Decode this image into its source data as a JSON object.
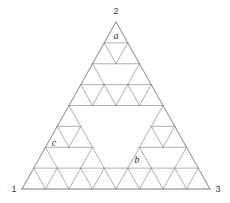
{
  "figure": {
    "type": "sierpinski-triangle",
    "title": "",
    "order": 3,
    "units_per_side": 8,
    "stroke_color": "#8c8c8c",
    "stroke_width": 0.7,
    "background_color": "#ffffff",
    "geometry": {
      "apex": {
        "x": 116,
        "y": 22
      },
      "base_left": {
        "x": 22,
        "y": 189
      },
      "base_right": {
        "x": 210,
        "y": 189
      }
    },
    "vertex_labels": [
      {
        "id": "vertex-1",
        "text": "1",
        "x": 14,
        "y": 192
      },
      {
        "id": "vertex-2",
        "text": "2",
        "x": 116,
        "y": 14
      },
      {
        "id": "vertex-3",
        "text": "3",
        "x": 218,
        "y": 192
      }
    ],
    "cell_labels": [
      {
        "id": "cell-a",
        "text": "a",
        "x": 116,
        "y": 39
      },
      {
        "id": "cell-b",
        "text": "b",
        "x": 137,
        "y": 163
      },
      {
        "id": "cell-c",
        "text": "c",
        "x": 54,
        "y": 146
      }
    ]
  }
}
